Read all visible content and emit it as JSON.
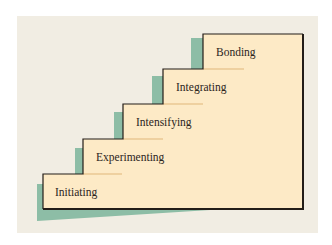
{
  "diagram": {
    "type": "staircase",
    "steps": [
      {
        "label": "Initiating"
      },
      {
        "label": "Experimenting"
      },
      {
        "label": "Intensifying"
      },
      {
        "label": "Integrating"
      },
      {
        "label": "Bonding"
      }
    ],
    "colors": {
      "background": "#f1ede3",
      "step_fill": "#fdeac6",
      "shadow": "#8dbda6",
      "outline": "#231d18",
      "underline": "#e0b77a",
      "text": "#2b241c"
    }
  }
}
